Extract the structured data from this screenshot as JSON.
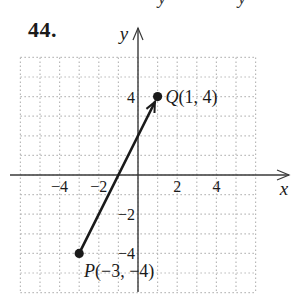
{
  "problem": {
    "number": "44."
  },
  "cropped_text_above": [
    "y",
    "y"
  ],
  "chart_data": {
    "type": "scatter",
    "title": "",
    "xlabel": "x",
    "ylabel": "y",
    "xlim": [
      -6,
      6
    ],
    "ylim": [
      -6,
      6
    ],
    "grid": true,
    "grid_style": "dotted",
    "x_ticks": [
      {
        "value": -4,
        "label": "−4"
      },
      {
        "value": -2,
        "label": "−2"
      },
      {
        "value": 2,
        "label": "2"
      },
      {
        "value": 4,
        "label": "4"
      }
    ],
    "y_ticks": [
      {
        "value": 4,
        "label": "4"
      },
      {
        "value": -2,
        "label": "−2"
      },
      {
        "value": -4,
        "label": "−4"
      }
    ],
    "points": [
      {
        "name": "P",
        "x": -3,
        "y": -4,
        "label": "P(−3, −4)"
      },
      {
        "name": "Q",
        "x": 1,
        "y": 4,
        "label": "Q(1, 4)"
      }
    ],
    "vectors": [
      {
        "from": "P",
        "to": "Q",
        "from_xy": [
          -3,
          -4
        ],
        "to_xy": [
          1,
          4
        ]
      }
    ]
  },
  "colors": {
    "ink": "#1a1a1a",
    "axis": "#3a3a3a",
    "grid": "#b8b8b8",
    "background": "#ffffff"
  }
}
